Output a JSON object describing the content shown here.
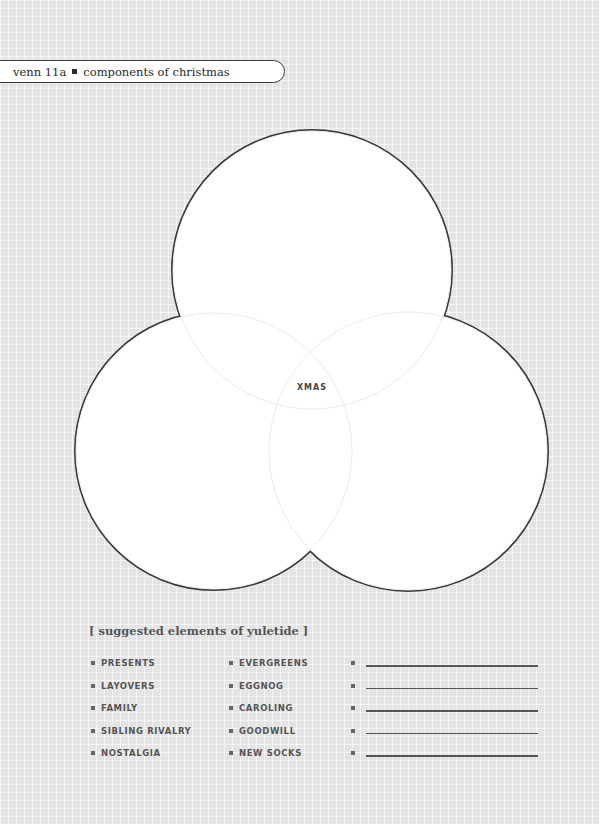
{
  "header": {
    "label": "venn 11a",
    "title": "components of christmas"
  },
  "diagram": {
    "type": "venn",
    "circles": [
      {
        "name": "top",
        "cx": 312,
        "cy": 270,
        "r": 140
      },
      {
        "name": "left",
        "cx": 214,
        "cy": 451,
        "r": 139
      },
      {
        "name": "right",
        "cx": 408,
        "cy": 451,
        "r": 140
      }
    ],
    "center_label": "XMAS",
    "outline_color": "#3a3a3a",
    "fill_color": "#ffffff"
  },
  "suggestions": {
    "title": "[ suggested elements of yuletide ]",
    "column1": [
      "PRESENTS",
      "LAYOVERS",
      "FAMILY",
      "SIBLING RIVALRY",
      "NOSTALGIA"
    ],
    "column2": [
      "EVERGREENS",
      "EGGNOG",
      "CAROLING",
      "GOODWILL",
      "NEW SOCKS"
    ],
    "blank_count": 5
  }
}
